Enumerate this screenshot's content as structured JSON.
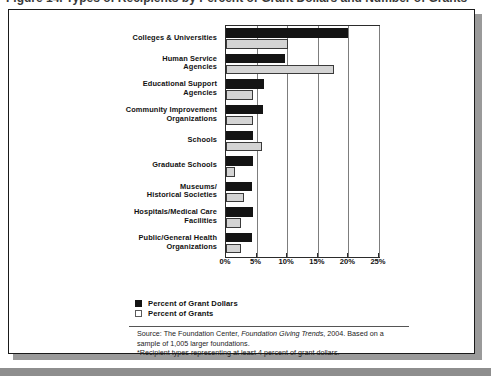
{
  "figure": {
    "title_fragment": "Figure 14. Types of Recipients by Percent of Grant Dollars and Number of Grants*"
  },
  "chart_data": {
    "type": "bar",
    "orientation": "horizontal",
    "title": "",
    "xlabel": "",
    "ylabel": "",
    "xlim": [
      0,
      25
    ],
    "xticks": [
      0,
      5,
      10,
      15,
      20,
      25
    ],
    "xtick_labels": [
      "0%",
      "5%",
      "10%",
      "15%",
      "20%",
      "25%"
    ],
    "grid": true,
    "legend_position": "below-left",
    "categories": [
      "Colleges & Universities",
      "Human Service\nAgencies",
      "Educational Support\nAgencies",
      "Community Improvement\nOrganizations",
      "Schools",
      "Graduate Schools",
      "Museums/\nHistorical Societies",
      "Hospitals/Medical Care\nFacilities",
      "Public/General Health\nOrganizations"
    ],
    "series": [
      {
        "name": "Percent of Grant Dollars",
        "color": "#141414",
        "values": [
          20.0,
          9.7,
          6.2,
          6.0,
          4.4,
          4.4,
          4.2,
          4.4,
          4.3
        ]
      },
      {
        "name": "Percent of Grants",
        "color": "#d4d4d4",
        "values": [
          10.2,
          17.7,
          4.4,
          4.4,
          5.9,
          1.4,
          2.9,
          2.4,
          2.5
        ]
      }
    ]
  },
  "legend": {
    "items": [
      {
        "label": "Percent of Grant Dollars"
      },
      {
        "label": "Percent of Grants"
      }
    ]
  },
  "source_note": {
    "line1_prefix": "Source: The Foundation Center, ",
    "line1_italic": "Foundation Giving Trends",
    "line1_suffix": ", 2004. Based on a",
    "line2": "sample of 1,005 larger foundations.",
    "line3": "*Recipient types representing at least 4 percent of grant dollars."
  }
}
